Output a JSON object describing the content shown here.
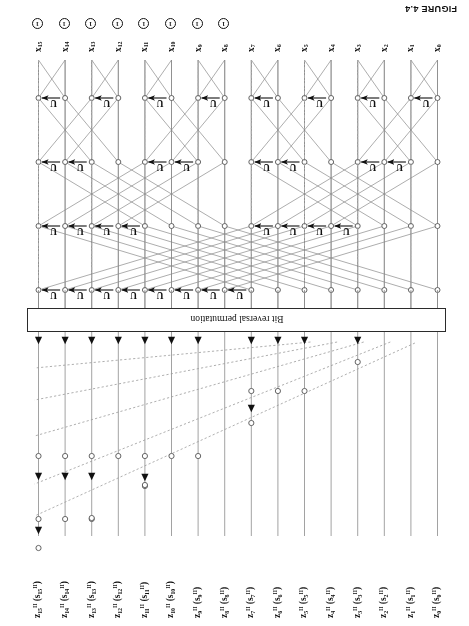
{
  "figure": {
    "caption": "FIGURE 4.4",
    "permutation_box_label": "Bit reversal permutation",
    "gate_symbol": "U",
    "phase_symbol": "1",
    "n_wires": 16,
    "wire_indices": [
      0,
      1,
      2,
      3,
      4,
      5,
      6,
      7,
      8,
      9,
      10,
      11,
      12,
      13,
      14,
      15
    ]
  },
  "top_labels": [
    {
      "base": "z",
      "sub": "0",
      "sup": "II",
      "arg_base": "s",
      "arg_sub": "0",
      "arg_sup": "II"
    },
    {
      "base": "z",
      "sub": "1",
      "sup": "II",
      "arg_base": "s",
      "arg_sub": "1",
      "arg_sup": "II"
    },
    {
      "base": "z",
      "sub": "2",
      "sup": "II",
      "arg_base": "s",
      "arg_sub": "2",
      "arg_sup": "II"
    },
    {
      "base": "z",
      "sub": "3",
      "sup": "II",
      "arg_base": "s",
      "arg_sub": "3",
      "arg_sup": "II"
    },
    {
      "base": "z",
      "sub": "4",
      "sup": "II",
      "arg_base": "s",
      "arg_sub": "4",
      "arg_sup": "II"
    },
    {
      "base": "z",
      "sub": "5",
      "sup": "II",
      "arg_base": "s",
      "arg_sub": "5",
      "arg_sup": "II"
    },
    {
      "base": "z",
      "sub": "6",
      "sup": "II",
      "arg_base": "s",
      "arg_sub": "6",
      "arg_sup": "II"
    },
    {
      "base": "z",
      "sub": "7",
      "sup": "II",
      "arg_base": "s",
      "arg_sub": "7",
      "arg_sup": "II"
    },
    {
      "base": "z",
      "sub": "8",
      "sup": "II",
      "arg_base": "s",
      "arg_sub": "8",
      "arg_sup": "II"
    },
    {
      "base": "z",
      "sub": "9",
      "sup": "II",
      "arg_base": "s",
      "arg_sub": "9",
      "arg_sup": "II"
    },
    {
      "base": "z",
      "sub": "10",
      "sup": "II",
      "arg_base": "s",
      "arg_sub": "10",
      "arg_sup": "II"
    },
    {
      "base": "z",
      "sub": "11",
      "sup": "II",
      "arg_base": "s",
      "arg_sub": "11",
      "arg_sup": "II"
    },
    {
      "base": "z",
      "sub": "12",
      "sup": "II",
      "arg_base": "s",
      "arg_sub": "12",
      "arg_sup": "II"
    },
    {
      "base": "z",
      "sub": "13",
      "sup": "II",
      "arg_base": "s",
      "arg_sub": "13",
      "arg_sup": "II"
    },
    {
      "base": "z",
      "sub": "14",
      "sup": "II",
      "arg_base": "s",
      "arg_sub": "14",
      "arg_sup": "II"
    },
    {
      "base": "z",
      "sub": "15",
      "sup": "II",
      "arg_base": "s",
      "arg_sub": "15",
      "arg_sup": "II"
    }
  ],
  "bottom_labels": [
    {
      "base": "x",
      "sub": "0",
      "phase": false
    },
    {
      "base": "x",
      "sub": "1",
      "phase": false
    },
    {
      "base": "x",
      "sub": "2",
      "phase": false
    },
    {
      "base": "x",
      "sub": "3",
      "phase": false
    },
    {
      "base": "x",
      "sub": "4",
      "phase": false
    },
    {
      "base": "x",
      "sub": "5",
      "phase": false
    },
    {
      "base": "x",
      "sub": "6",
      "phase": false
    },
    {
      "base": "x",
      "sub": "7",
      "phase": false
    },
    {
      "base": "x",
      "sub": "8",
      "phase": true
    },
    {
      "base": "x",
      "sub": "9",
      "phase": true
    },
    {
      "base": "x",
      "sub": "10",
      "phase": true
    },
    {
      "base": "x",
      "sub": "11",
      "phase": true
    },
    {
      "base": "x",
      "sub": "12",
      "phase": true
    },
    {
      "base": "x",
      "sub": "13",
      "phase": true
    },
    {
      "base": "x",
      "sub": "14",
      "phase": true
    },
    {
      "base": "x",
      "sub": "15",
      "phase": true
    }
  ],
  "colors": {
    "line": "#8a8a8a",
    "ink": "#111111",
    "dashed": "#9a9a9a",
    "box_border": "#2b2b2b",
    "background": "#ffffff"
  }
}
